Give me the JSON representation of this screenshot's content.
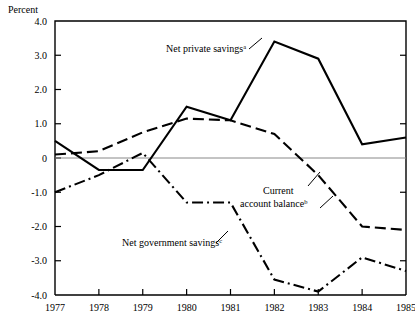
{
  "chart_data": {
    "type": "line",
    "title": "",
    "xlabel": "",
    "ylabel": "Percent",
    "x": [
      1977,
      1978,
      1979,
      1980,
      1981,
      1982,
      1983,
      1984,
      1985
    ],
    "xtick_labels": [
      "1977",
      "1978",
      "1979",
      "1980",
      "1981",
      "1982",
      "1983",
      "1984",
      "1985"
    ],
    "ytick_labels": [
      "4.0",
      "3.0",
      "2.0",
      "1.0",
      "0",
      "-1.0",
      "-2.0",
      "-3.0",
      "-4.0"
    ],
    "yticks": [
      4.0,
      3.0,
      2.0,
      1.0,
      0,
      -1.0,
      -2.0,
      -3.0,
      -4.0
    ],
    "ylim": [
      -4.0,
      4.0
    ],
    "xlim": [
      1977,
      1985
    ],
    "grid": false,
    "zero_line": true,
    "legend_position": "inline-annotations",
    "series": [
      {
        "name": "Net private savings",
        "footnote": "a",
        "style": "solid",
        "color": "#000000",
        "values": [
          0.5,
          -0.35,
          -0.35,
          1.5,
          1.1,
          3.4,
          2.9,
          0.4,
          0.6
        ]
      },
      {
        "name": "Current account balance",
        "footnote": "b",
        "style": "dashed",
        "color": "#000000",
        "values": [
          0.1,
          0.2,
          0.75,
          1.15,
          1.1,
          0.7,
          -0.5,
          -2.0,
          -2.1
        ]
      },
      {
        "name": "Net government savings",
        "footnote": "c",
        "style": "dash-dot",
        "color": "#000000",
        "values": [
          -1.0,
          -0.5,
          0.15,
          -1.3,
          -1.3,
          -3.55,
          -3.9,
          -2.9,
          -3.3
        ]
      }
    ],
    "annotations": [
      {
        "text": "Net private savings",
        "footnote": "a",
        "x_px": 166,
        "y_px": 52
      },
      {
        "text": "Current",
        "footnote": "",
        "x_px": 263,
        "y_px": 194
      },
      {
        "text": "account balance",
        "footnote": "b",
        "x_px": 240,
        "y_px": 207
      },
      {
        "text": "Net government savings",
        "footnote": "c",
        "x_px": 122,
        "y_px": 246
      }
    ]
  }
}
